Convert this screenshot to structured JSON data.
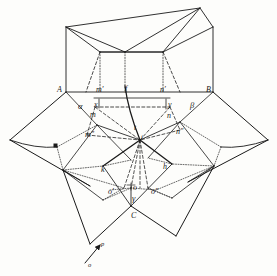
{
  "figure": {
    "domain": "line-drawing-geometric-diagram",
    "background_color": "#fdfdfb",
    "ink_color": "#1a1a1a",
    "width": 277,
    "height": 276
  },
  "labels": [
    {
      "id": "A",
      "text": "A",
      "x": 57,
      "y": 86,
      "style": "cap"
    },
    {
      "id": "B",
      "text": "B",
      "x": 206,
      "y": 86,
      "style": "cap"
    },
    {
      "id": "C",
      "text": "C",
      "x": 131,
      "y": 212,
      "style": "cap"
    },
    {
      "id": "alpha",
      "text": "α",
      "x": 78,
      "y": 102,
      "style": "greek"
    },
    {
      "id": "beta",
      "text": "β",
      "x": 190,
      "y": 101,
      "style": "greek"
    },
    {
      "id": "gamma",
      "text": "γ",
      "x": 132,
      "y": 194,
      "style": "greek"
    },
    {
      "id": "m-prime",
      "text": "m′",
      "x": 96,
      "y": 86,
      "style": "normal"
    },
    {
      "id": "n-prime",
      "text": "n′",
      "x": 160,
      "y": 86,
      "style": "normal"
    },
    {
      "id": "f",
      "text": "f",
      "x": 125,
      "y": 85,
      "style": "normal"
    },
    {
      "id": "x",
      "text": "x",
      "x": 94,
      "y": 101,
      "style": "normal"
    },
    {
      "id": "y",
      "text": "y",
      "x": 168,
      "y": 101,
      "style": "normal"
    },
    {
      "id": "m",
      "text": "m",
      "x": 93,
      "y": 111,
      "style": "normal"
    },
    {
      "id": "n",
      "text": "n",
      "x": 167,
      "y": 112,
      "style": "normal"
    },
    {
      "id": "m-dprime",
      "text": "m″",
      "x": 87,
      "y": 131,
      "style": "normal"
    },
    {
      "id": "n-dprime",
      "text": "n″",
      "x": 178,
      "y": 128,
      "style": "normal"
    },
    {
      "id": "t",
      "text": "t",
      "x": 134,
      "y": 124,
      "style": "normal"
    },
    {
      "id": "i",
      "text": "i",
      "x": 140,
      "y": 135,
      "style": "small"
    },
    {
      "id": "k",
      "text": "k",
      "x": 101,
      "y": 166,
      "style": "normal"
    },
    {
      "id": "h",
      "text": "h",
      "x": 163,
      "y": 163,
      "style": "normal"
    },
    {
      "id": "o-prime",
      "text": "o′",
      "x": 110,
      "y": 188,
      "style": "normal"
    },
    {
      "id": "o",
      "text": "o",
      "x": 132,
      "y": 186,
      "style": "normal"
    },
    {
      "id": "o-dprime",
      "text": "o″",
      "x": 152,
      "y": 188,
      "style": "normal"
    },
    {
      "id": "p",
      "text": "p",
      "x": 101,
      "y": 243,
      "style": "small"
    },
    {
      "id": "o-bottom",
      "text": "o",
      "x": 90,
      "y": 263,
      "style": "small"
    }
  ],
  "geometry": {
    "top_box": {
      "A": [
        66,
        92
      ],
      "B": [
        213,
        92
      ],
      "top_left": [
        66,
        27
      ],
      "top_right": [
        213,
        27
      ],
      "inner_top_left": [
        100,
        52
      ],
      "inner_top_right": [
        163,
        52
      ],
      "apex_left": [
        71,
        25
      ],
      "apex_right": [
        200,
        8
      ],
      "center_fold": [
        125,
        52
      ]
    },
    "star_points": {
      "left": [
        10,
        140
      ],
      "right": [
        268,
        140
      ],
      "bottom_left": [
        90,
        244
      ],
      "bottom_right": [
        176,
        236
      ]
    },
    "center": [
      140,
      140
    ],
    "markers": [
      {
        "id": "left-node-marker",
        "x": 55,
        "y": 145,
        "w": 4,
        "h": 4
      }
    ]
  },
  "line_styles": {
    "solid": "continuous engraved contour",
    "dashed": "long-dash construction line",
    "dotted": "fine-dot hidden edge",
    "thick": "heavy foreground edge"
  },
  "arrow": {
    "name": "direction-arrow-p",
    "from": [
      85,
      263
    ],
    "to": [
      100,
      245
    ],
    "label": "p",
    "tail_label": "o"
  }
}
